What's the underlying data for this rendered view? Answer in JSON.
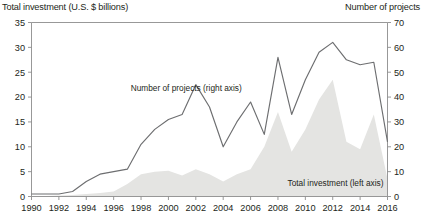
{
  "axis_titles": {
    "left": "Total investment (U.S. $ billions)",
    "right": "Number of projects"
  },
  "annotations": {
    "line_series": "Number of projects (right axis)",
    "area_series": "Total investment (left axis)"
  },
  "chart_data": {
    "type": "area",
    "title": "",
    "subtitle": "",
    "xlabel": "",
    "ylabel": "Total investment (U.S. $ billions)",
    "y2label": "Number of projects",
    "grid": false,
    "legend_position": "inline-annotation",
    "xlim": [
      1990,
      2016
    ],
    "ylim": [
      0,
      35
    ],
    "y2lim": [
      0,
      70
    ],
    "yticks": [
      0,
      5,
      10,
      15,
      20,
      25,
      30,
      35
    ],
    "y2ticks": [
      0,
      10,
      20,
      30,
      40,
      50,
      60,
      70
    ],
    "xticks": [
      1990,
      1992,
      1994,
      1996,
      1998,
      2000,
      2002,
      2004,
      2006,
      2008,
      2010,
      2012,
      2014,
      2016
    ],
    "xticklabels": [
      "1990",
      "1992",
      "1994",
      "1996",
      "1998",
      "2000",
      "2002",
      "2004",
      "2006",
      "2008",
      "2010",
      "2012",
      "2014",
      "2016"
    ],
    "x": [
      1990,
      1991,
      1992,
      1993,
      1994,
      1995,
      1996,
      1997,
      1998,
      1999,
      2000,
      2001,
      2002,
      2003,
      2004,
      2005,
      2006,
      2007,
      2008,
      2009,
      2010,
      2011,
      2012,
      2013,
      2014,
      2015,
      2016
    ],
    "series": [
      {
        "name": "Total investment (left axis)",
        "label": "Total investment (left axis)",
        "axis": "left",
        "render": "area",
        "units": "U.S. $ billions",
        "color": "#e3e3e1",
        "values": [
          0.1,
          0.1,
          0.2,
          0.3,
          0.5,
          0.7,
          1.0,
          2.5,
          4.5,
          5.0,
          5.2,
          4.2,
          5.5,
          4.5,
          3.0,
          4.5,
          5.5,
          10.0,
          17.0,
          9.0,
          13.5,
          19.5,
          23.5,
          11.0,
          9.5,
          16.5,
          3.5
        ]
      },
      {
        "name": "Number of projects (right axis)",
        "label": "Number of projects (right axis)",
        "axis": "right",
        "render": "line",
        "units": "projects",
        "color": "#6d6e70",
        "values": [
          1,
          1,
          1,
          2,
          6,
          9,
          10,
          11,
          21,
          27,
          31,
          33,
          45,
          36,
          20,
          30,
          38,
          25,
          56,
          33,
          47,
          58,
          62,
          55,
          53,
          54,
          22
        ]
      }
    ]
  }
}
